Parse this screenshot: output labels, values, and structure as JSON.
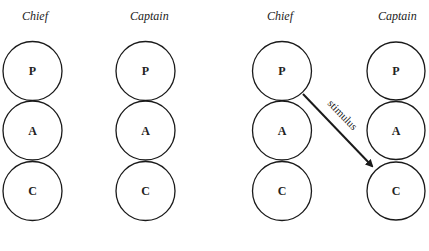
{
  "diagram": {
    "type": "transactional-analysis-ego-states",
    "stroke_color": "#1a1a1a",
    "panels": [
      {
        "name": "left",
        "columns": [
          {
            "title": "Chief",
            "states": [
              "P",
              "A",
              "C"
            ]
          },
          {
            "title": "Captain",
            "states": [
              "P",
              "A",
              "C"
            ]
          }
        ]
      },
      {
        "name": "right",
        "columns": [
          {
            "title": "Chief",
            "states": [
              "P",
              "A",
              "C"
            ]
          },
          {
            "title": "Captain",
            "states": [
              "P",
              "A",
              "C"
            ]
          }
        ],
        "arrow": {
          "from": "Chief.P",
          "to": "Captain.C",
          "label": "stimulus"
        }
      }
    ]
  }
}
